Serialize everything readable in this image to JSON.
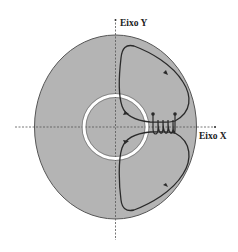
{
  "diagram": {
    "axes": {
      "y_label": "Eixo Y",
      "x_label": "Eixo X"
    },
    "colors": {
      "disk_fill": "#b4b4b4",
      "disk_stroke": "#555555",
      "ring": "#ffffff",
      "lines": "#2a2a2a",
      "axis": "#555555"
    },
    "elements": [
      "elliptical-disk",
      "inner-ring",
      "coil",
      "upper-field-loop",
      "lower-field-loop",
      "x-axis",
      "y-axis"
    ]
  }
}
